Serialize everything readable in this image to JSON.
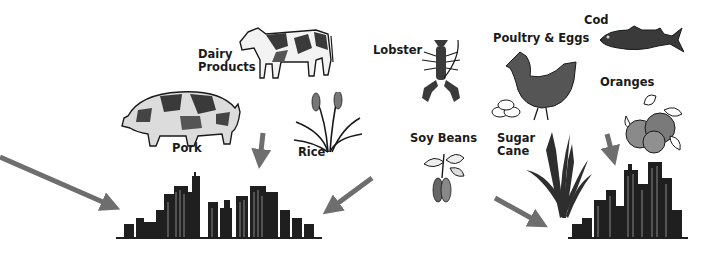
{
  "diagram": {
    "type": "flow-illustration",
    "colors": {
      "arrow": "#6e6e6e",
      "ink": "#1a1a1a",
      "fill_dark": "#4a4a4a",
      "fill_mid": "#8a8a8a",
      "background": "#ffffff"
    },
    "products": [
      {
        "id": "dairy",
        "label_line1": "Dairy",
        "label_line2": "Products",
        "icon": "cow-icon"
      },
      {
        "id": "pork",
        "label": "Pork",
        "icon": "pig-icon"
      },
      {
        "id": "rice",
        "label": "Rice",
        "icon": "rice-plant-icon"
      },
      {
        "id": "lobster",
        "label": "Lobster",
        "icon": "lobster-icon"
      },
      {
        "id": "soy",
        "label": "Soy Beans",
        "icon": "soybean-plant-icon"
      },
      {
        "id": "poultry",
        "label": "Poultry & Eggs",
        "icon": "hen-icon"
      },
      {
        "id": "sugar",
        "label_line1": "Sugar",
        "label_line2": "Cane",
        "icon": "sugar-cane-icon"
      },
      {
        "id": "cod",
        "label": "Cod",
        "icon": "fish-icon"
      },
      {
        "id": "oranges",
        "label": "Oranges",
        "icon": "oranges-icon"
      }
    ],
    "destinations": [
      {
        "id": "city-left",
        "icon": "city-skyline-icon"
      },
      {
        "id": "city-right",
        "icon": "city-skyline-icon"
      }
    ],
    "arrows": [
      {
        "from": "off-left",
        "to": "city-left"
      },
      {
        "from": "dairy/pork",
        "to": "city-left"
      },
      {
        "from": "rice/right",
        "to": "city-left"
      },
      {
        "from": "soy",
        "to": "city-right"
      },
      {
        "from": "oranges",
        "to": "city-right"
      }
    ]
  }
}
